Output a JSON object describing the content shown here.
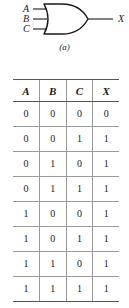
{
  "figure": {
    "caption": "(a)",
    "gate": {
      "type": "or-gate",
      "inputs": [
        "A",
        "B",
        "C"
      ],
      "output": "X",
      "stroke_color": "#1a1a1a"
    }
  },
  "truth_table": {
    "headers": [
      "A",
      "B",
      "C",
      "X"
    ],
    "rows": [
      [
        "0",
        "0",
        "0",
        "0"
      ],
      [
        "0",
        "0",
        "1",
        "1"
      ],
      [
        "0",
        "1",
        "0",
        "1"
      ],
      [
        "0",
        "1",
        "1",
        "1"
      ],
      [
        "1",
        "0",
        "0",
        "1"
      ],
      [
        "1",
        "0",
        "1",
        "1"
      ],
      [
        "1",
        "1",
        "0",
        "1"
      ],
      [
        "1",
        "1",
        "1",
        "1"
      ]
    ],
    "rule_color": "#555555",
    "grid_color": "#9a9a9a"
  }
}
